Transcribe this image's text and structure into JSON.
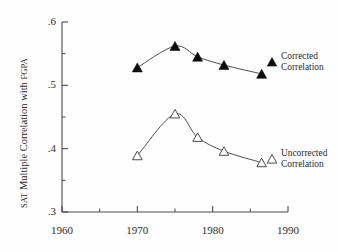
{
  "chart_data": {
    "type": "line",
    "title": "",
    "xlabel": "",
    "ylabel": "SAT Multiple Correlation with FGPA",
    "ylabel_parts": {
      "sat": "SAT",
      "middle": " Multiple Correlation with ",
      "fgpa": "FGPA"
    },
    "xlim": [
      1960,
      1990
    ],
    "ylim": [
      0.3,
      0.6
    ],
    "grid": false,
    "legend_position": "right-inline",
    "x_ticks_major": [
      "1960",
      "1970",
      "1980",
      "1990"
    ],
    "x_ticks_major_values": [
      1960,
      1970,
      1980,
      1990
    ],
    "x_ticks_minor_values": [
      1965,
      1975,
      1985
    ],
    "y_ticks_major": [
      ".6",
      ".5",
      ".4",
      ".3"
    ],
    "y_ticks_major_values": [
      0.6,
      0.5,
      0.4,
      0.3
    ],
    "y_ticks_minor_values": [
      0.55,
      0.45,
      0.35
    ],
    "series": [
      {
        "name": "Corrected Correlation",
        "marker": "filled-triangle",
        "label_line1": "Corrected",
        "label_line2": "Correlation",
        "x": [
          1970,
          1975,
          1978,
          1981.5,
          1986.5
        ],
        "values": [
          0.528,
          0.562,
          0.545,
          0.532,
          0.518
        ]
      },
      {
        "name": "Uncorrected Correlation",
        "marker": "open-triangle",
        "label_line1": "Uncorrected",
        "label_line2": "Correlation",
        "x": [
          1970,
          1975,
          1978,
          1981.5,
          1986.5
        ],
        "values": [
          0.389,
          0.455,
          0.418,
          0.396,
          0.378
        ]
      }
    ],
    "colors": {
      "axis": "#4a4a4a",
      "line": "#3a3a3a",
      "marker_filled": "#0d0d0d",
      "marker_open_stroke": "#3a3a3a",
      "marker_open_fill": "#ffffff",
      "text": "#2b2b2b",
      "background": "#fefefe"
    }
  }
}
